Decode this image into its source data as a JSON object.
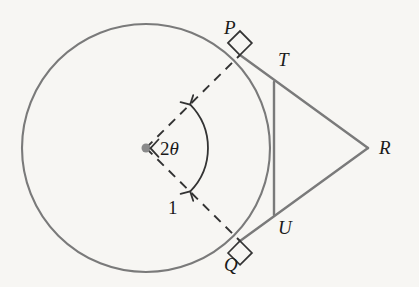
{
  "figure": {
    "type": "geometry-diagram",
    "background_color": "#f7f6f3",
    "stroke_color": "#7a7a7a",
    "dash_color": "#333333",
    "label_color": "#1a1a1a"
  },
  "circle": {
    "center_x": 146,
    "center_y": 148,
    "radius": 124,
    "center_dot_radius": 4.5
  },
  "points": {
    "center": {
      "label": "",
      "x": 146,
      "y": 148
    },
    "P": {
      "label": "P",
      "x": 240,
      "y": 55,
      "label_x": 224,
      "label_y": 18
    },
    "Q": {
      "label": "Q",
      "x": 240,
      "y": 241,
      "label_x": 224,
      "label_y": 255
    },
    "T": {
      "label": "T",
      "x": 274,
      "y": 82,
      "label_x": 278,
      "label_y": 50
    },
    "U": {
      "label": "U",
      "x": 274,
      "y": 215,
      "label_x": 278,
      "label_y": 218
    },
    "R": {
      "label": "R",
      "x": 368,
      "y": 148,
      "label_x": 379,
      "label_y": 138
    }
  },
  "segments": [
    {
      "name": "tangent-P-to-R",
      "from": "P",
      "to": "R"
    },
    {
      "name": "tangent-Q-to-R",
      "from": "Q",
      "to": "R"
    },
    {
      "name": "chord-T-to-U",
      "from": "T",
      "to": "U"
    }
  ],
  "dashed_segments": [
    {
      "name": "radius-center-to-P",
      "from": "center",
      "to": "P"
    },
    {
      "name": "radius-center-to-Q",
      "from": "center",
      "to": "Q"
    }
  ],
  "right_angles": [
    {
      "name": "right-angle-at-P",
      "at": "P",
      "size": 17
    },
    {
      "name": "right-angle-at-Q",
      "at": "Q",
      "size": 17
    }
  ],
  "annotations": {
    "angle": {
      "value": "2",
      "symbol": "θ",
      "full_text": "2θ",
      "label_x": 160,
      "label_y": 139,
      "arc_radius": 62,
      "arc_start_deg": -44.7,
      "arc_end_deg": 44.7
    },
    "length": {
      "value": "1",
      "label_x": 168,
      "label_y": 198
    }
  }
}
